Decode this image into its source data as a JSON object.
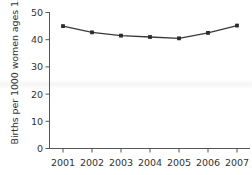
{
  "chart_data": {
    "type": "line",
    "title": "",
    "subtitle": "",
    "xlabel": "",
    "ylabel": "Births per 1000 women ages 15-19",
    "categories": [
      "2001",
      "2002",
      "2003",
      "2004",
      "2005",
      "2006",
      "2007"
    ],
    "x": [
      2001,
      2002,
      2003,
      2004,
      2005,
      2006,
      2007
    ],
    "values": [
      45.0,
      42.7,
      41.5,
      41.0,
      40.5,
      42.5,
      45.2
    ],
    "series": [
      {
        "name": "Births per 1000 women ages 15-19",
        "values": [
          45.0,
          42.7,
          41.5,
          41.0,
          40.5,
          42.5,
          45.2
        ]
      }
    ],
    "ylim": [
      0,
      50
    ],
    "yticks": [
      0,
      10,
      20,
      30,
      40,
      50
    ],
    "ytick_labels": [
      "0",
      "10",
      "20",
      "30",
      "40",
      "50"
    ],
    "xtick_labels": [
      "2001",
      "2002",
      "2003",
      "2004",
      "2005",
      "2006",
      "2007"
    ],
    "grid": false,
    "legend": false,
    "legend_position": "none",
    "line_color": "#3a3a3a",
    "marker": "square",
    "marker_color": "#2b2b2b",
    "axis_color": "#555555",
    "text_color": "#333333"
  }
}
